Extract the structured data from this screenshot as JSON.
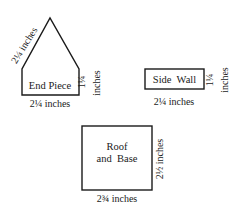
{
  "diagram": {
    "stroke_color": "#1a1a1a",
    "background": "#ffffff",
    "pieces": [
      {
        "id": "end-piece",
        "label": "End Piece",
        "dimensions": {
          "roof_slope": "2¼ inches",
          "wall_height_value": "1¼",
          "wall_height_unit": "inches",
          "width": "2¼ inches"
        }
      },
      {
        "id": "side-wall",
        "label": "Side  Wall",
        "dimensions": {
          "height_value": "1¼",
          "height_unit": "inches",
          "width": "2¼ inches"
        }
      },
      {
        "id": "roof-and-base",
        "label_line1": "Roof",
        "label_line2": "and  Base",
        "dimensions": {
          "height": "2½ inches",
          "width": "2¾ inches"
        }
      }
    ]
  }
}
